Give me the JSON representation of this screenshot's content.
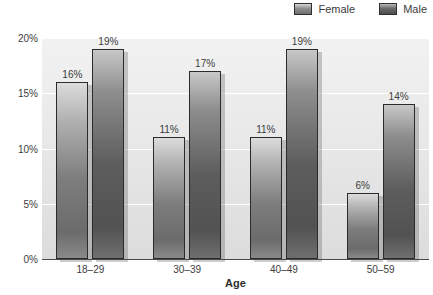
{
  "chart_data": {
    "type": "bar",
    "title": "",
    "xlabel": "Age",
    "ylabel": "",
    "categories": [
      "18–29",
      "30–39",
      "40–49",
      "50–59"
    ],
    "series": [
      {
        "name": "Female",
        "values": [
          16,
          11,
          11,
          6
        ],
        "labels": [
          "16%",
          "11%",
          "11%",
          "6%"
        ],
        "color": "#8f8f8f"
      },
      {
        "name": "Male",
        "values": [
          19,
          17,
          19,
          14
        ],
        "labels": [
          "19%",
          "17%",
          "19%",
          "14%"
        ],
        "color": "#5d5d5d"
      }
    ],
    "ylim": [
      0,
      20
    ],
    "yticks": [
      0,
      5,
      10,
      15,
      20
    ],
    "ytick_labels": [
      "0%",
      "5%",
      "10%",
      "15%",
      "20%"
    ],
    "grid": true,
    "legend_position": "top-right"
  },
  "legend": {
    "items": [
      {
        "label": "Female",
        "swatch": "female-swatch"
      },
      {
        "label": "Male",
        "swatch": "male-swatch"
      }
    ]
  },
  "axes": {
    "x_title": "Age"
  }
}
